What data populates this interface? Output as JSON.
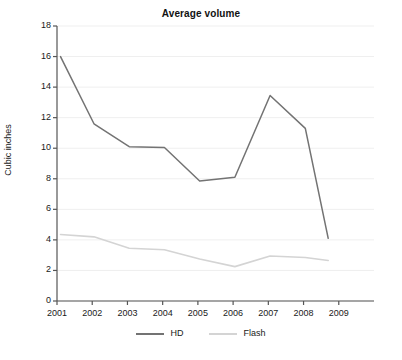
{
  "chart_data": {
    "type": "line",
    "title": "Average volume",
    "xlabel": "",
    "ylabel": "Cubic inches",
    "x": [
      2001,
      2002,
      2003,
      2004,
      2005,
      2006,
      2007,
      2008,
      2009
    ],
    "categories": [
      "2001",
      "2002",
      "2003",
      "2004",
      "2005",
      "2006",
      "2007",
      "2008",
      "2009"
    ],
    "xlim": [
      2001,
      2009
    ],
    "ylim": [
      0,
      18
    ],
    "yticks": [
      0,
      2,
      4,
      6,
      8,
      10,
      12,
      14,
      16,
      18
    ],
    "ytick_labels": [
      "0",
      "2",
      "4",
      "6",
      "8",
      "10",
      "12",
      "14",
      "16",
      "18"
    ],
    "grid": true,
    "grid_axis": "y",
    "legend_position": "bottom",
    "series": [
      {
        "name": "HD",
        "color": "#737373",
        "values": [
          16.0,
          11.6,
          10.1,
          10.05,
          7.85,
          8.1,
          13.45,
          11.3,
          4.1
        ]
      },
      {
        "name": "Flash",
        "color": "#d4d4d4",
        "values": [
          4.35,
          4.2,
          3.45,
          3.35,
          2.75,
          2.25,
          2.95,
          2.85,
          2.65
        ]
      }
    ]
  },
  "axis": {
    "ylabel": "Cubic inches"
  },
  "legend": {
    "entries": [
      {
        "label": "HD",
        "color": "#737373"
      },
      {
        "label": "Flash",
        "color": "#d4d4d4"
      }
    ]
  },
  "colors": {
    "background": "#ffffff",
    "axis": "#555555",
    "grid": "#efefef",
    "text": "#1a1a1a",
    "hd": "#737373",
    "flash": "#d4d4d4"
  }
}
